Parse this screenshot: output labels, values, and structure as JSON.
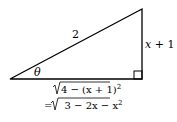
{
  "diagram": {
    "hypotenuse_label": "2",
    "opposite_label_var": "x",
    "opposite_label_rest": " + 1",
    "angle_label": "θ",
    "adjacent_line1": "4 − (x + 1)",
    "adjacent_line1_exp": "2",
    "adjacent_line2_prefix": "= ",
    "adjacent_line2": "3 − 2x − x",
    "adjacent_line2_exp": "2",
    "colors": {
      "stroke": "#000000",
      "background": "#ffffff"
    }
  }
}
